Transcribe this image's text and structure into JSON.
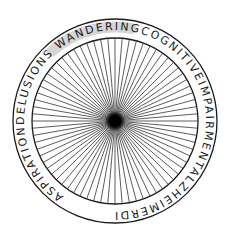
{
  "diagram": {
    "center": {
      "x": 115,
      "y": 121
    },
    "outer_radius": 102,
    "inner_radius": 83,
    "text_radius": 91,
    "spoke_count": 72,
    "colors": {
      "stroke": "#1a1a1a",
      "spoke": "#333333",
      "highlight": "#d6d6d6",
      "background": "#ffffff"
    },
    "ring_text_segments": [
      {
        "text": "ASPIRATION",
        "highlighted": false
      },
      {
        "text": "DELUSIONS",
        "highlighted": true
      },
      {
        "text": " WANDERING",
        "highlighted": false
      },
      {
        "text": "COGNITIVEIMPAIRMENT",
        "highlighted": false
      },
      {
        "text": "ALZHEIMERDISEASE",
        "highlighted": false
      }
    ],
    "ring_text_full": "ASPIRATIONDELUSIONS WANDERINGCOGNITIVEIMPAIRMENTALZHEIMERDISEASE",
    "highlighted_term": "DELUSIONS"
  }
}
